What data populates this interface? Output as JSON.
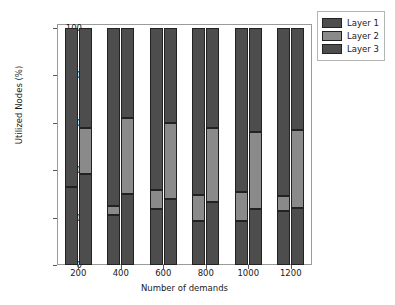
{
  "chart_data": {
    "type": "bar",
    "title": "",
    "subtitle": "",
    "xlabel": "Number of demands",
    "ylabel": "Utilized Nodes (%)",
    "categories": [
      "200",
      "400",
      "600",
      "800",
      "1000",
      "1200"
    ],
    "ylim": [
      0,
      100
    ],
    "yticks": [
      0,
      20,
      40,
      60,
      80,
      100
    ],
    "ytick_labels": [
      "0",
      "20",
      "40",
      "60",
      "80",
      "100"
    ],
    "grid": false,
    "legend_position": "upper right",
    "stacked": true,
    "grouped": true,
    "bars_per_group": 2,
    "series": [
      {
        "name": "Layer 1",
        "color": "#4d4d4d",
        "values_bar_a": [
          33.0,
          21.0,
          23.5,
          18.5,
          18.5,
          23.0
        ],
        "values_bar_b": [
          38.5,
          30.0,
          28.0,
          26.5,
          23.5,
          24.0
        ]
      },
      {
        "name": "Layer 2",
        "color": "#8a8a8a",
        "values_bar_a": [
          0.0,
          4.0,
          8.0,
          11.0,
          12.5,
          6.0
        ],
        "values_bar_b": [
          19.5,
          32.0,
          32.0,
          31.5,
          32.5,
          33.0
        ]
      },
      {
        "name": "Layer 3",
        "color": "#4d4d4d",
        "values_bar_a": [
          67.0,
          75.0,
          68.5,
          70.5,
          69.0,
          71.0
        ],
        "values_bar_b": [
          42.0,
          38.0,
          40.0,
          42.0,
          44.0,
          43.0
        ]
      }
    ],
    "cumulative_boundaries": {
      "bar_a_layer1_top": [
        33.0,
        21.0,
        23.5,
        18.5,
        18.5,
        23.0
      ],
      "bar_a_layer2_top": [
        33.0,
        25.0,
        31.5,
        29.5,
        31.0,
        29.0
      ],
      "bar_b_layer1_top": [
        38.5,
        30.0,
        28.0,
        26.5,
        23.5,
        24.0
      ],
      "bar_b_layer2_top": [
        58.0,
        62.0,
        60.0,
        58.0,
        56.0,
        57.0
      ],
      "total": 100
    }
  },
  "legend": {
    "items": [
      {
        "label": "Layer 1",
        "color": "#4d4d4d"
      },
      {
        "label": "Layer 2",
        "color": "#8a8a8a"
      },
      {
        "label": "Layer 3",
        "color": "#4d4d4d"
      }
    ]
  }
}
